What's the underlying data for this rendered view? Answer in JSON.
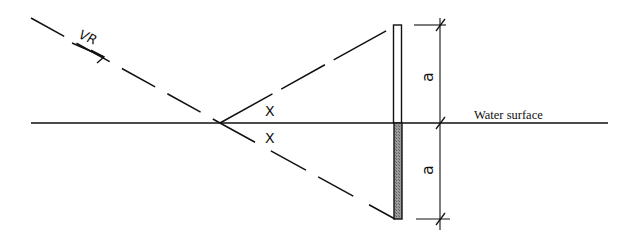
{
  "diagram": {
    "labels": {
      "ray": "VR",
      "angle_upper": "X",
      "angle_lower": "X",
      "dim_upper": "a",
      "dim_lower": "a",
      "water_surface": "Water surface"
    },
    "colors": {
      "line": "#111111",
      "submerged_fill": "#8a8a8a",
      "background": "#ffffff"
    }
  }
}
